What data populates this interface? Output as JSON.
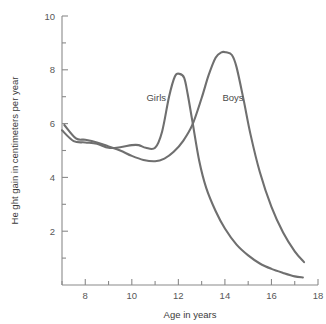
{
  "chart_data": {
    "type": "line",
    "title": "",
    "xlabel": "Age in years",
    "ylabel": "Height gain in centimeters per year",
    "ylabel_rendered": "He ght gain in centimeters per year",
    "xlim": [
      7,
      18
    ],
    "ylim": [
      0,
      10
    ],
    "grid": false,
    "legend": "inline-annotations",
    "x_ticks_major": [
      8,
      10,
      12,
      14,
      16,
      18
    ],
    "x_ticks_minor": [
      7,
      9,
      11,
      13,
      15,
      17
    ],
    "x_tick_labels": [
      "8",
      "10",
      "12",
      "14",
      "16",
      "18"
    ],
    "y_ticks_major": [
      2,
      4,
      6,
      8,
      10
    ],
    "y_ticks_minor": [
      1,
      3,
      5,
      7,
      9
    ],
    "y_tick_labels": [
      "2",
      "4",
      "6",
      "8",
      "10"
    ],
    "series": [
      {
        "name": "Girls",
        "color": "#6f6f6f",
        "label_x": 11.05,
        "label_y": 6.85,
        "x": [
          7.0,
          7.5,
          8.0,
          8.5,
          9.0,
          9.5,
          10.0,
          10.3,
          10.6,
          11.0,
          11.3,
          11.6,
          11.85,
          12.05,
          12.25,
          12.4,
          12.6,
          12.9,
          13.2,
          13.6,
          14.0,
          14.5,
          15.0,
          15.5,
          16.0,
          16.5,
          17.0,
          17.35
        ],
        "values": [
          5.75,
          5.35,
          5.3,
          5.25,
          5.1,
          5.12,
          5.2,
          5.2,
          5.1,
          5.1,
          5.7,
          7.0,
          7.75,
          7.85,
          7.7,
          7.1,
          6.1,
          4.6,
          3.6,
          2.75,
          2.1,
          1.5,
          1.1,
          0.8,
          0.6,
          0.45,
          0.32,
          0.28
        ]
      },
      {
        "name": "Boys",
        "color": "#6f6f6f",
        "label_x": 14.35,
        "label_y": 6.85,
        "x": [
          7.1,
          7.6,
          8.0,
          8.5,
          9.0,
          9.5,
          10.0,
          10.5,
          11.0,
          11.4,
          11.8,
          12.2,
          12.6,
          13.0,
          13.3,
          13.6,
          13.85,
          14.05,
          14.3,
          14.5,
          14.8,
          15.1,
          15.5,
          16.0,
          16.5,
          17.0,
          17.4
        ],
        "values": [
          5.95,
          5.45,
          5.4,
          5.3,
          5.15,
          5.0,
          4.8,
          4.65,
          4.6,
          4.7,
          4.95,
          5.35,
          5.95,
          6.95,
          7.8,
          8.45,
          8.65,
          8.65,
          8.55,
          8.1,
          6.9,
          5.6,
          4.2,
          2.9,
          1.95,
          1.25,
          0.85
        ]
      }
    ],
    "annotations": [
      {
        "text": "Girls",
        "x": 11.05,
        "y": 6.85
      },
      {
        "text": "Boys",
        "x": 14.35,
        "y": 6.85
      }
    ]
  },
  "colors": {
    "curve": "#6f6f6f",
    "axis": "#8a8a8a",
    "text": "#4a4a4a",
    "background": "#ffffff"
  },
  "labels": {
    "x_axis_title": "Age in years",
    "y_axis_title": "He ght gain in centimeters per year",
    "girls": "Girls",
    "boys": "Boys",
    "y10": "10",
    "y8": "8",
    "y6": "6",
    "y4": "4",
    "y2": "2",
    "x8": "8",
    "x10": "10",
    "x12": "12",
    "x14": "14",
    "x16": "16",
    "x18": "18"
  }
}
